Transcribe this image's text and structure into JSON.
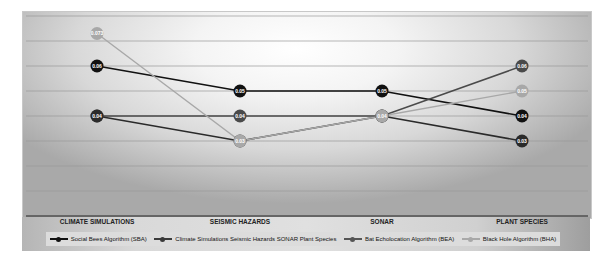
{
  "chart_data": {
    "type": "line",
    "title": "",
    "xlabel": "",
    "ylabel": "",
    "categories": [
      "CLIMATE SIMULATIONS",
      "SEISMIC HAZARDS",
      "SONAR",
      "PLANT SPECIES"
    ],
    "series": [
      {
        "name": "Social Bees Algorithm (SBA)",
        "color": "#111111",
        "values": [
          0.06,
          0.05,
          0.05,
          0.04
        ],
        "labels": [
          "0.06",
          "0.05",
          "0.05",
          "0.04"
        ]
      },
      {
        "name": "Climate Simulations Seismic Hazards SONAR Plant Species",
        "color": "#4a4a4a",
        "values": [
          0.04,
          0.04,
          0.04,
          0.06
        ],
        "labels": [
          "0.04",
          "0.04",
          "0.04",
          "0.06"
        ]
      },
      {
        "name": "Bat Echolocation Algorithm (BEA)",
        "color": "#2a2a2a",
        "values": [
          0.04,
          0.03,
          0.04,
          0.03
        ],
        "labels": [
          "0.04",
          "0.03",
          "0.04",
          "0.03"
        ]
      },
      {
        "name": "Black Hole Algorithm (BHA)",
        "color": "#a8a8a8",
        "values": [
          0.073,
          0.03,
          0.04,
          0.05
        ],
        "labels": [
          "0.073",
          "0.03",
          "0.04",
          "0.05"
        ]
      }
    ],
    "ylim": [
      -0.01,
      0.08
    ],
    "y_axis_visible": false,
    "grid": true,
    "data_labels": true,
    "legend_position": "bottom"
  },
  "legend": {
    "items": [
      {
        "label": "Social Bees Algorithm (SBA)",
        "color": "#111111"
      },
      {
        "label": "Climate Simulations Seismic Hazards SONAR Plant Species",
        "color": "#3a3a3a"
      },
      {
        "label": "Bat Echolocation Algorithm (BEA)",
        "color": "#555555"
      },
      {
        "label": "Black Hole Algorithm (BHA)",
        "color": "#a8a8a8"
      }
    ]
  }
}
